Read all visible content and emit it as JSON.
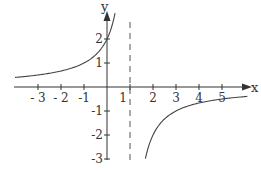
{
  "chart_data": {
    "type": "line",
    "title": "",
    "function": "y = 2/(1 - x)",
    "xlabel": "x",
    "ylabel": "y",
    "xlim": [
      -4,
      6.2
    ],
    "ylim": [
      -3,
      3.2
    ],
    "grid": false,
    "x_ticks": [
      -3,
      -2,
      -1,
      1,
      2,
      3,
      4,
      5
    ],
    "x_tick_labels": [
      "- 3",
      "- 2",
      "-1",
      "1",
      "2",
      "3",
      "4",
      "5"
    ],
    "y_ticks": [
      2,
      1,
      -1,
      -2,
      -3
    ],
    "y_tick_labels": [
      "2",
      "1",
      "-1",
      "-2",
      "-3"
    ],
    "asymptotes": [
      {
        "type": "vertical",
        "x": 1,
        "style": "dashed"
      }
    ],
    "series": [
      {
        "name": "left branch",
        "x": [
          -4,
          -3,
          -2,
          -1,
          -0.5,
          0,
          0.2,
          0.35
        ],
        "y": [
          0.4,
          0.5,
          0.67,
          1,
          1.33,
          2,
          2.5,
          3.08
        ]
      },
      {
        "name": "right branch",
        "x": [
          1.67,
          2,
          2.5,
          3,
          4,
          5,
          6.1
        ],
        "y": [
          -3,
          -2,
          -1.33,
          -1,
          -0.67,
          -0.5,
          -0.39
        ]
      }
    ],
    "colors": {
      "curve": "#444444",
      "axes": "#333333",
      "asymptote": "#555555"
    }
  },
  "axes": {
    "x_label": "x",
    "y_label": "y"
  }
}
